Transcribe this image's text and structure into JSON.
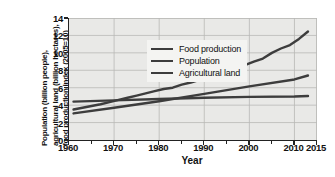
{
  "chart_data": {
    "type": "line",
    "title": "",
    "xlabel": "Year",
    "ylabel_lines": [
      "Population (billion people),",
      "agricultural land (billion hectares),",
      "food production index (2005=10)"
    ],
    "xlim": [
      1960,
      2015
    ],
    "ylim": [
      0,
      14
    ],
    "xticks": [
      1960,
      1970,
      1980,
      1990,
      2000,
      2010,
      2015
    ],
    "xtick_labels": [
      "1960",
      "1970",
      "1980",
      "1990",
      "2000",
      "2010",
      "2015"
    ],
    "xminor_ticks": [
      1965,
      1975,
      1985,
      1995,
      2005
    ],
    "yticks": [
      0,
      2,
      4,
      6,
      8,
      10,
      12,
      14
    ],
    "ytick_labels": [
      "0",
      "2",
      "4",
      "6",
      "8",
      "10",
      "12",
      "14"
    ],
    "grid": true,
    "legend_position": "upper left inside",
    "line_color": "#3d3d3d",
    "plot_background": "#e9e9e7",
    "grid_color": "#b9b9b6",
    "axis_color": "#222222",
    "series": [
      {
        "name": "Food production",
        "x": [
          1961,
          1963,
          1965,
          1967,
          1969,
          1971,
          1973,
          1975,
          1977,
          1979,
          1981,
          1983,
          1985,
          1987,
          1989,
          1991,
          1993,
          1995,
          1997,
          1999,
          2001,
          2003,
          2005,
          2007,
          2009,
          2011,
          2013
        ],
        "values": [
          3.5,
          3.7,
          3.9,
          4.1,
          4.35,
          4.6,
          4.85,
          5.1,
          5.35,
          5.6,
          5.85,
          6.0,
          6.35,
          6.6,
          6.9,
          7.2,
          7.35,
          7.7,
          8.2,
          8.6,
          9.0,
          9.35,
          10.0,
          10.5,
          10.9,
          11.6,
          12.45
        ]
      },
      {
        "name": "Population",
        "x": [
          1961,
          1970,
          1980,
          1990,
          2000,
          2010,
          2013
        ],
        "values": [
          3.05,
          3.7,
          4.45,
          5.3,
          6.15,
          6.95,
          7.4
        ]
      },
      {
        "name": "Agricultural land",
        "x": [
          1961,
          1970,
          1980,
          1990,
          2000,
          2010,
          2013
        ],
        "values": [
          4.4,
          4.55,
          4.7,
          4.85,
          4.95,
          5.0,
          5.05
        ]
      }
    ]
  },
  "legend": {
    "items": [
      {
        "label": "Food production"
      },
      {
        "label": "Population"
      },
      {
        "label": "Agricultural land"
      }
    ]
  }
}
